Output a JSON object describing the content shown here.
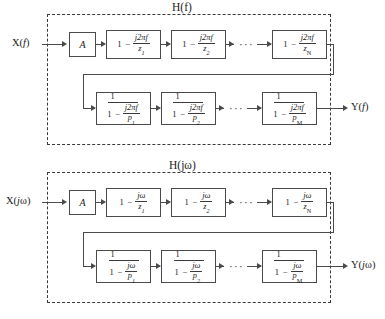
{
  "figure": {
    "panels": [
      {
        "id": "panel-f",
        "system_label": "H(f)",
        "input_label": "X(f)",
        "output_label": "Y(f)",
        "gain_label": "A",
        "ellipsis": "···",
        "zero_stages": [
          {
            "lead": "1",
            "op": "−",
            "numerator": "j2πf",
            "denominator": "z",
            "subscript": "1"
          },
          {
            "lead": "1",
            "op": "−",
            "numerator": "j2πf",
            "denominator": "z",
            "subscript": "2"
          },
          {
            "lead": "1",
            "op": "−",
            "numerator": "j2πf",
            "denominator": "z",
            "subscript": "N"
          }
        ],
        "pole_stages": [
          {
            "outer_numerator": "1",
            "lead": "1",
            "op": "−",
            "numerator": "j2πf",
            "denominator": "p",
            "subscript": "1"
          },
          {
            "outer_numerator": "1",
            "lead": "1",
            "op": "−",
            "numerator": "j2πf",
            "denominator": "p",
            "subscript": "2"
          },
          {
            "outer_numerator": "1",
            "lead": "1",
            "op": "−",
            "numerator": "j2πf",
            "denominator": "p",
            "subscript": "M"
          }
        ]
      },
      {
        "id": "panel-w",
        "system_label": "H(jω)",
        "input_label": "X(jω)",
        "output_label": "Y(jω)",
        "gain_label": "A",
        "ellipsis": "···",
        "zero_stages": [
          {
            "lead": "1",
            "op": "−",
            "numerator": "jω",
            "denominator": "z",
            "subscript": "1"
          },
          {
            "lead": "1",
            "op": "−",
            "numerator": "jω",
            "denominator": "z",
            "subscript": "2"
          },
          {
            "lead": "1",
            "op": "−",
            "numerator": "jω",
            "denominator": "z",
            "subscript": "N"
          }
        ],
        "pole_stages": [
          {
            "outer_numerator": "1",
            "lead": "1",
            "op": "−",
            "numerator": "jω",
            "denominator": "p",
            "subscript": "1"
          },
          {
            "outer_numerator": "1",
            "lead": "1",
            "op": "−",
            "numerator": "jω",
            "denominator": "p",
            "subscript": "2"
          },
          {
            "outer_numerator": "1",
            "lead": "1",
            "op": "−",
            "numerator": "jω",
            "denominator": "p",
            "subscript": "M"
          }
        ]
      }
    ],
    "colors": {
      "stroke": "#4a4a4a",
      "dashed_border": "#3a3a3a",
      "text": "#1a1a1a",
      "background": "#ffffff"
    }
  }
}
